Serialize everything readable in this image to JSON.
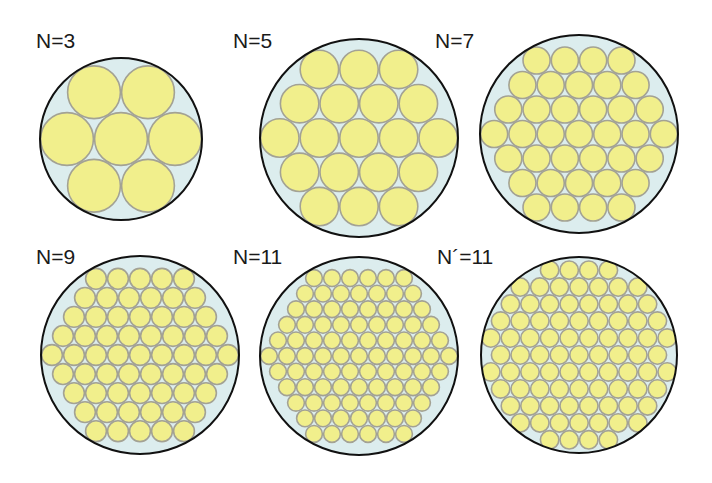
{
  "colors": {
    "background": "#ffffff",
    "container_fill": "#dcedee",
    "container_stroke": "#111111",
    "strand_fill": "#f1ef8c",
    "strand_stroke": "#a3a294"
  },
  "panels": [
    {
      "label": "N=3",
      "cx": 121,
      "cy": 139,
      "R": 81,
      "rows": [
        2,
        3,
        2
      ],
      "label_x": 36,
      "label_y": 48
    },
    {
      "label": "N=5",
      "cx": 359,
      "cy": 138,
      "R": 99,
      "rows": [
        3,
        4,
        5,
        4,
        3
      ],
      "label_x": 233,
      "label_y": 48
    },
    {
      "label": "N=7",
      "cx": 579,
      "cy": 134,
      "R": 99,
      "rows": [
        4,
        5,
        6,
        7,
        6,
        5,
        4
      ],
      "label_x": 435,
      "label_y": 48
    },
    {
      "label": "N=9",
      "cx": 140,
      "cy": 355,
      "R": 99,
      "rows": [
        5,
        6,
        7,
        8,
        9,
        8,
        7,
        6,
        5
      ],
      "label_x": 36,
      "label_y": 264
    },
    {
      "label": "N=11",
      "cx": 359,
      "cy": 356,
      "R": 99,
      "rows": [
        6,
        7,
        8,
        9,
        10,
        11,
        10,
        9,
        8,
        7,
        6
      ],
      "label_x": 233,
      "label_y": 264
    },
    {
      "label": "N´=11",
      "cx": 579,
      "cy": 355,
      "R": 98,
      "rows": [
        4,
        7,
        8,
        9,
        10,
        9,
        10,
        9,
        8,
        7,
        4
      ],
      "label_x": 437,
      "label_y": 264
    }
  ]
}
